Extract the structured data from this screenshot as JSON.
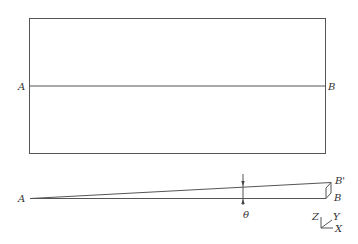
{
  "top_view": {
    "label_left": "A",
    "label_right": "B"
  },
  "side_view": {
    "label_apex": "A",
    "label_b_prime": "B'",
    "label_b": "B",
    "angle_label": "θ"
  },
  "axes": {
    "z": "Z",
    "y": "Y",
    "x": "X"
  },
  "colors": {
    "line": "#555555",
    "text": "#333333",
    "background": "#ffffff"
  }
}
